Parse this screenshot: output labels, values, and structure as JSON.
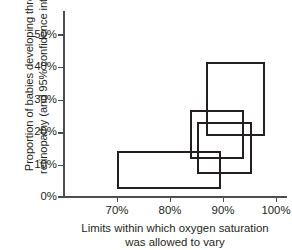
{
  "chart_data": {
    "type": "bar",
    "title": "",
    "subtitle": "",
    "xlabel_lines": [
      "Limits within which oxygen saturation",
      "was allowed to vary"
    ],
    "ylabel_lines": [
      "Proportion of babies developing threshold",
      "retinopathy (and 95% confidence intervals)"
    ],
    "xlabel": "Limits within which oxygen saturation was allowed to vary",
    "ylabel": "Proportion of babies developing threshold retinopathy (and 95% confidence intervals)",
    "xlim": [
      65,
      101
    ],
    "ylim": [
      0,
      55
    ],
    "grid": false,
    "legend": null,
    "xticks": [
      70,
      80,
      90,
      100
    ],
    "xtick_labels": [
      "70%",
      "80%",
      "90%",
      "100%"
    ],
    "yticks": [
      0,
      10,
      20,
      30,
      40,
      50
    ],
    "ytick_labels": [
      "0%",
      "10%",
      "20%",
      "30%",
      "40%",
      "50%"
    ],
    "boxes": [
      {
        "name": "study-1",
        "x_low": 70.0,
        "x_high": 89.6,
        "y_low": 2.5,
        "y_high": 14.2,
        "proportion": 8.4
      },
      {
        "name": "study-2",
        "x_low": 83.8,
        "x_high": 93.9,
        "y_low": 11.5,
        "y_high": 26.5,
        "proportion": 19.0
      },
      {
        "name": "study-3",
        "x_low": 85.0,
        "x_high": 95.5,
        "y_low": 7.0,
        "y_high": 23.0,
        "proportion": 15.0
      },
      {
        "name": "study-4",
        "x_low": 86.8,
        "x_high": 97.9,
        "y_low": 18.5,
        "y_high": 41.5,
        "proportion": 30.0
      }
    ]
  },
  "colors": {
    "box_stroke": "#231f20",
    "axis": "#4d4d4f",
    "text": "#231f20",
    "background": "#ffffff"
  }
}
